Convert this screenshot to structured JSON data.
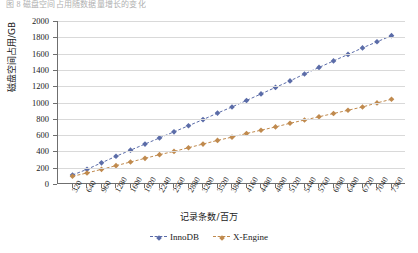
{
  "top_partial_text": "图 8  磁盘空间占用随数据量增长的变化",
  "axes": {
    "y_title": "磁盘空间占用/GB",
    "x_title": "记录条数/百万",
    "y_ticks": [
      0,
      200,
      400,
      600,
      800,
      1000,
      1200,
      1400,
      1600,
      1800,
      2000
    ]
  },
  "legend": {
    "position": "bottom",
    "items": [
      {
        "label": "InnoDB",
        "color": "#5b6ca8",
        "marker": "diamond"
      },
      {
        "label": "X-Engine",
        "color": "#c08a4e",
        "marker": "diamond"
      }
    ]
  },
  "chart_data": {
    "type": "line",
    "title": "",
    "subtitle": "",
    "xlabel": "记录条数/百万",
    "ylabel": "磁盘空间占用/GB",
    "xlim": [
      0,
      7680
    ],
    "ylim": [
      0,
      2000
    ],
    "grid": true,
    "legend_position": "bottom",
    "categories": [
      320,
      640,
      960,
      1280,
      1600,
      1920,
      2240,
      2560,
      2880,
      3200,
      3520,
      3840,
      4160,
      4480,
      4800,
      5120,
      5440,
      5760,
      6080,
      6400,
      6720,
      7040,
      7360
    ],
    "tick_labels": [
      "320",
      "640",
      "960",
      "1280",
      "1600",
      "1920",
      "2240",
      "2560",
      "2880",
      "3200",
      "3520",
      "3840",
      "4160",
      "4480",
      "4800",
      "5120",
      "5440",
      "5760",
      "6080",
      "6400",
      "6720",
      "7040",
      "7360"
    ],
    "series": [
      {
        "name": "InnoDB",
        "color": "#5b6ca8",
        "values": [
          110,
          180,
          260,
          340,
          415,
          490,
          565,
          640,
          715,
          790,
          870,
          945,
          1025,
          1105,
          1185,
          1265,
          1350,
          1430,
          1510,
          1590,
          1670,
          1745,
          1820
        ]
      },
      {
        "name": "X-Engine",
        "color": "#c08a4e",
        "values": [
          95,
          135,
          180,
          225,
          270,
          315,
          360,
          400,
          445,
          490,
          535,
          575,
          620,
          660,
          700,
          745,
          785,
          825,
          865,
          905,
          945,
          995,
          1040
        ]
      }
    ]
  }
}
